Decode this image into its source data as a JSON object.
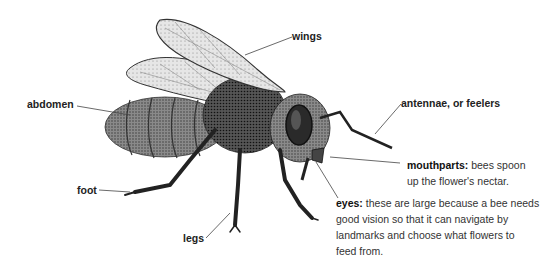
{
  "diagram": {
    "subject": "bee",
    "labels": {
      "wings": "wings",
      "abdomen": "abdomen",
      "antennae": "antennae, or feelers",
      "foot": "foot",
      "legs": "legs"
    },
    "callouts": {
      "mouthparts": {
        "term": "mouthparts:",
        "line1": "bees spoon",
        "line2": "up the flower's nectar."
      },
      "eyes": {
        "term": "eyes:",
        "line1": "these are large because a bee needs",
        "line2": "good vision so that it can navigate by",
        "line3": "landmarks and choose what flowers to",
        "line4": "feed from."
      }
    },
    "colors": {
      "background": "#ffffff",
      "ink": "#222222",
      "leader_line": "#444444"
    }
  }
}
